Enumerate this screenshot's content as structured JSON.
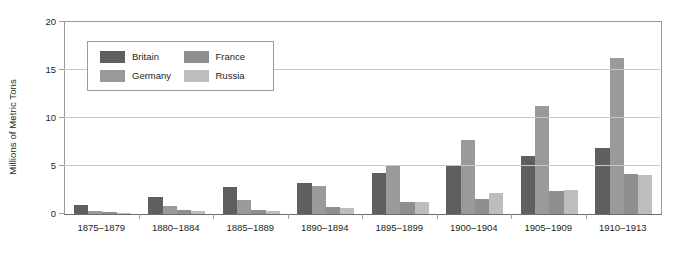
{
  "chart_data": {
    "type": "bar",
    "title": "",
    "subtitle": "",
    "xlabel": "",
    "ylabel": "Millions of Metric Tons",
    "ylim": [
      0,
      20
    ],
    "yticks": [
      "0",
      "5",
      "10",
      "15",
      "20"
    ],
    "grid": true,
    "legend_position": "upper-left-inside",
    "categories": [
      "1875–1879",
      "1880–1884",
      "1885–1889",
      "1890–1894",
      "1895–1899",
      "1900–1904",
      "1905–1909",
      "1910–1913"
    ],
    "series": [
      {
        "name": "Britain",
        "color": "#5f5f5f",
        "values": [
          0.9,
          1.8,
          2.8,
          3.2,
          4.3,
          5.0,
          6.0,
          6.9
        ]
      },
      {
        "name": "Germany",
        "color": "#9a9a9a",
        "values": [
          0.3,
          0.8,
          1.5,
          2.9,
          5.1,
          7.7,
          11.2,
          16.2
        ]
      },
      {
        "name": "France",
        "color": "#8e8e8e",
        "values": [
          0.2,
          0.4,
          0.4,
          0.7,
          1.2,
          1.6,
          2.4,
          4.2
        ]
      },
      {
        "name": "Russia",
        "color": "#bdbdbd",
        "values": [
          0.1,
          0.3,
          0.3,
          0.6,
          1.3,
          2.2,
          2.5,
          4.1
        ]
      }
    ]
  },
  "axis": {
    "y_title": "Millions of Metric Tons"
  }
}
